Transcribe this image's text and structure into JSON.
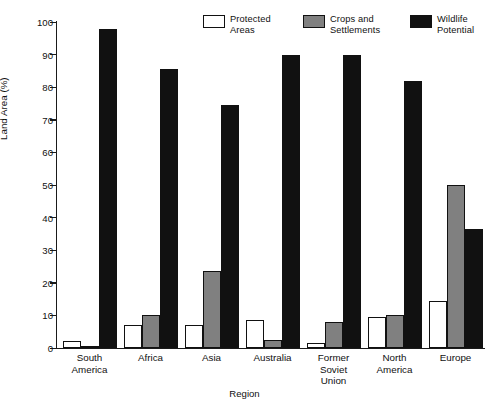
{
  "chart_data": {
    "type": "bar",
    "title": "",
    "xlabel": "Region",
    "ylabel": "Land Area (%)",
    "ylim": [
      0,
      100
    ],
    "ytick_step": 10,
    "grid": false,
    "legend_position": "top-right",
    "categories": [
      "South\nAmerica",
      "Africa",
      "Asia",
      "Australia",
      "Former\nSoviet\nUnion",
      "North\nAmerica",
      "Europe"
    ],
    "yticks": [
      "0",
      "10",
      "20",
      "30",
      "40",
      "50",
      "60",
      "70",
      "80",
      "90",
      "100"
    ],
    "series": [
      {
        "name": "Protected\nAreas",
        "color": "#ffffff",
        "values": [
          2,
          7,
          7,
          8.5,
          1.5,
          9.5,
          14.5
        ]
      },
      {
        "name": "Crops and\nSettlements",
        "color": "#808080",
        "values": [
          0.5,
          10,
          23.5,
          2.5,
          8,
          10,
          50
        ]
      },
      {
        "name": "Wildlife\nPotential",
        "color": "#111111",
        "values": [
          98,
          85.5,
          74.5,
          90,
          90,
          82,
          36.5
        ]
      }
    ]
  },
  "legend": {
    "items": [
      {
        "label": "Protected\nAreas",
        "color": "#ffffff"
      },
      {
        "label": "Crops and\nSettlements",
        "color": "#808080"
      },
      {
        "label": "Wildlife\nPotential",
        "color": "#111111"
      }
    ]
  }
}
